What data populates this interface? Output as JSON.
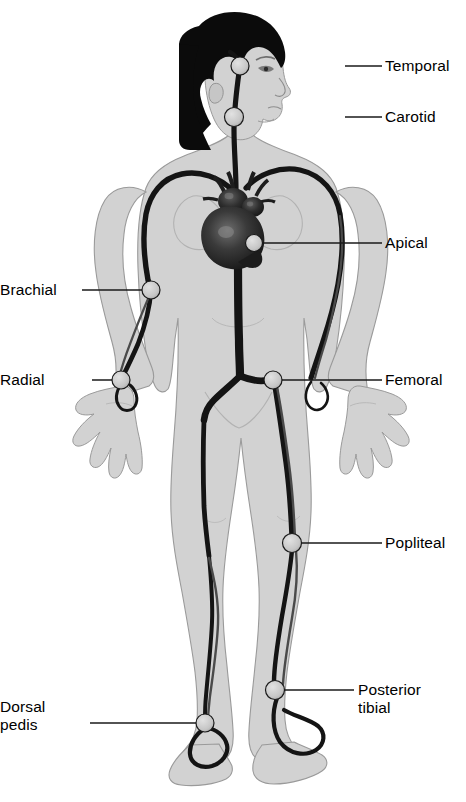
{
  "diagram": {
    "background_color": "#ffffff",
    "body_fill": "#d2d2d2",
    "body_outline": "#8a8a8a",
    "artery_color": "#141414",
    "artery_secondary_color": "#4a4a4a",
    "hair_color": "#0b0b0b",
    "heart_color": "#2b2b2b",
    "marker_fill": "#c8c8c8",
    "marker_stroke": "#1a1a1a",
    "leader_color": "#1a1a1a"
  },
  "labels": [
    {
      "id": "temporal",
      "text": "Temporal",
      "side": "right",
      "lines": [
        "Temporal"
      ],
      "text_x": 385,
      "text_y": 57,
      "leader_x1": 345,
      "leader_y1": 66,
      "leader_x2": 382,
      "leader_y2": 66,
      "marker_x": 240,
      "marker_y": 66,
      "marker_r": 9
    },
    {
      "id": "carotid",
      "text": "Carotid",
      "side": "right",
      "lines": [
        "Carotid"
      ],
      "text_x": 385,
      "text_y": 108,
      "leader_x1": 345,
      "leader_y1": 117,
      "leader_x2": 382,
      "leader_y2": 117,
      "marker_x": 234,
      "marker_y": 117,
      "marker_r": 9.5
    },
    {
      "id": "apical",
      "text": "Apical",
      "side": "right",
      "lines": [
        "Apical"
      ],
      "text_x": 385,
      "text_y": 234,
      "leader_x1": 262,
      "leader_y1": 243,
      "leader_x2": 382,
      "leader_y2": 243,
      "marker_x": 254,
      "marker_y": 243,
      "marker_r": 8.5
    },
    {
      "id": "brachial",
      "text": "Brachial",
      "side": "left",
      "lines": [
        "Brachial"
      ],
      "text_x": 12,
      "text_y": 281,
      "leader_x1": 82,
      "leader_y1": 290,
      "leader_x2": 145,
      "leader_y2": 290,
      "marker_x": 151,
      "marker_y": 290,
      "marker_r": 9
    },
    {
      "id": "radial",
      "text": "Radial",
      "side": "left",
      "lines": [
        "Radial"
      ],
      "text_x": 28,
      "text_y": 371,
      "leader_x1": 92,
      "leader_y1": 380,
      "leader_x2": 115,
      "leader_y2": 380,
      "marker_x": 121,
      "marker_y": 380,
      "marker_r": 9
    },
    {
      "id": "femoral",
      "text": "Femoral",
      "side": "right",
      "lines": [
        "Femoral"
      ],
      "text_x": 385,
      "text_y": 371,
      "leader_x1": 281,
      "leader_y1": 380,
      "leader_x2": 382,
      "leader_y2": 380,
      "marker_x": 273,
      "marker_y": 380,
      "marker_r": 9
    },
    {
      "id": "popliteal",
      "text": "Popliteal",
      "side": "right",
      "lines": [
        "Popliteal"
      ],
      "text_x": 385,
      "text_y": 534,
      "leader_x1": 301,
      "leader_y1": 543,
      "leader_x2": 382,
      "leader_y2": 543,
      "marker_x": 292,
      "marker_y": 543,
      "marker_r": 9.5
    },
    {
      "id": "posterior-tibial",
      "text": "Posterior tibial",
      "side": "right",
      "lines": [
        "Posterior",
        "tibial"
      ],
      "text_x": 358,
      "text_y": 681,
      "leader_x1": 284,
      "leader_y1": 690,
      "leader_x2": 354,
      "leader_y2": 690,
      "marker_x": 275,
      "marker_y": 690,
      "marker_r": 9.5
    },
    {
      "id": "dorsal-pedis",
      "text": "Dorsal pedis",
      "side": "left",
      "lines": [
        "Dorsal",
        "pedis"
      ],
      "text_x": 22,
      "text_y": 698,
      "leader_x1": 90,
      "leader_y1": 723,
      "leader_x2": 197,
      "leader_y2": 723,
      "marker_x": 205,
      "marker_y": 723,
      "marker_r": 9
    }
  ]
}
